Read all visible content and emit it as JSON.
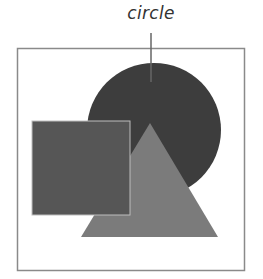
{
  "diagram": {
    "callout_label": "circle",
    "frame": {
      "x": 17,
      "y": 48,
      "width": 227,
      "height": 222,
      "stroke": "#8a8a8a"
    },
    "shapes": [
      {
        "id": "circle",
        "type": "circle",
        "cx": 154,
        "cy": 130,
        "r": 67,
        "fill": "#3d3d3d"
      },
      {
        "id": "triangle",
        "type": "triangle",
        "points": "150,123 81,237 218,237",
        "fill": "#7b7b7b"
      },
      {
        "id": "square",
        "type": "rect",
        "x": 32,
        "y": 121,
        "width": 98,
        "height": 94,
        "fill": "#565656",
        "stroke": "#bdbdbd"
      }
    ],
    "leader_line": {
      "x": 151,
      "y1": 33,
      "y2": 82,
      "stroke": "#666666"
    }
  }
}
